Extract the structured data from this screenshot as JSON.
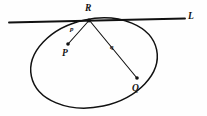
{
  "figure": {
    "background_color": "#fefefe",
    "stroke_color": "#111111",
    "width": 207,
    "height": 116,
    "labels": {
      "tangent_line": "L",
      "tangency_point": "R",
      "point_p": "P",
      "point_q": "Q",
      "segment_p": "p",
      "segment_q": "q"
    },
    "geometry": {
      "ellipse": {
        "center_x": 94,
        "center_y": 63,
        "radius_x": 64,
        "radius_y": 44,
        "rotation_deg": -12
      },
      "tangent_line": {
        "x1": 9,
        "y1": 22,
        "x2": 185,
        "y2": 18
      },
      "points": {
        "R": {
          "x": 89,
          "y": 20
        },
        "P": {
          "x": 68,
          "y": 44
        },
        "Q": {
          "x": 137,
          "y": 78
        }
      }
    }
  }
}
